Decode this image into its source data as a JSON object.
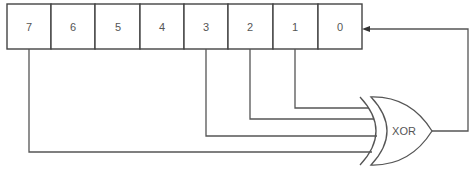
{
  "diagram": {
    "type": "linear-feedback-shift-register",
    "register": {
      "cells": [
        {
          "label": "7"
        },
        {
          "label": "6"
        },
        {
          "label": "5"
        },
        {
          "label": "4"
        },
        {
          "label": "3"
        },
        {
          "label": "2"
        },
        {
          "label": "1"
        },
        {
          "label": "0"
        }
      ]
    },
    "taps": [
      "7",
      "3",
      "2",
      "1"
    ],
    "gate": {
      "label": "XOR"
    },
    "feedback_target": "0",
    "colors": {
      "line": "#555555",
      "background": "#ffffff"
    }
  }
}
